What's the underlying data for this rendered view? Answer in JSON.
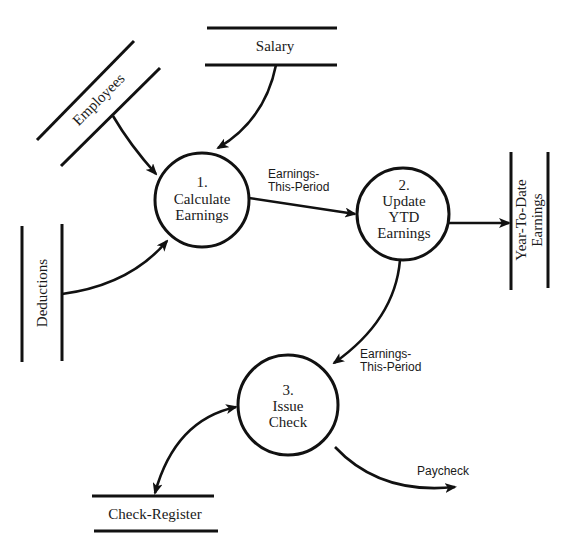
{
  "diagram": {
    "type": "data-flow-diagram",
    "processes": [
      {
        "id": "1",
        "number": "1.",
        "line1": "Calculate",
        "line2": "Earnings"
      },
      {
        "id": "2",
        "number": "2.",
        "line1": "Update",
        "line2": "YTD",
        "line3": "Earnings"
      },
      {
        "id": "3",
        "number": "3.",
        "line1": "Issue",
        "line2": "Check"
      }
    ],
    "data_stores": {
      "salary": "Salary",
      "employees": "Employees",
      "deductions": "Deductions",
      "ytd_line1": "Year-To-Date",
      "ytd_line2": "Earnings",
      "check_register": "Check-Register"
    },
    "flows": {
      "f1_line1": "Earnings-",
      "f1_line2": "This-Period",
      "f2_line1": "Earnings-",
      "f2_line2": "This-Period",
      "paycheck": "Paycheck"
    },
    "colors": {
      "ink": "#111111",
      "background": "#ffffff"
    }
  }
}
